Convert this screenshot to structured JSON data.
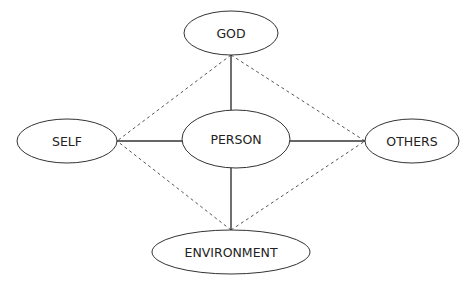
{
  "diagram": {
    "type": "relationship-diagram",
    "center_node": {
      "id": "person",
      "label": "PERSON"
    },
    "nodes": [
      {
        "id": "god",
        "label": "GOD",
        "cx": 231,
        "cy": 33,
        "rx": 47,
        "ry": 22
      },
      {
        "id": "self",
        "label": "SELF",
        "cx": 67,
        "cy": 141,
        "rx": 50,
        "ry": 22
      },
      {
        "id": "person",
        "label": "PERSON",
        "cx": 236,
        "cy": 139,
        "rx": 54,
        "ry": 29
      },
      {
        "id": "others",
        "label": "OTHERS",
        "cx": 412,
        "cy": 141,
        "rx": 47,
        "ry": 22
      },
      {
        "id": "environment",
        "label": "ENVIRONMENT",
        "cx": 231,
        "cy": 252,
        "rx": 79,
        "ry": 22
      }
    ],
    "edges_solid": [
      {
        "from": "god",
        "to": "person"
      },
      {
        "from": "self",
        "to": "person"
      },
      {
        "from": "person",
        "to": "others"
      },
      {
        "from": "person",
        "to": "environment"
      }
    ],
    "edges_dashed": [
      {
        "from": "god",
        "to": "self"
      },
      {
        "from": "god",
        "to": "others"
      },
      {
        "from": "environment",
        "to": "self"
      },
      {
        "from": "environment",
        "to": "others"
      }
    ],
    "colors": {
      "stroke": "#333333",
      "dashed_stroke": "#555555",
      "text": "#222222",
      "background": "#ffffff"
    }
  }
}
